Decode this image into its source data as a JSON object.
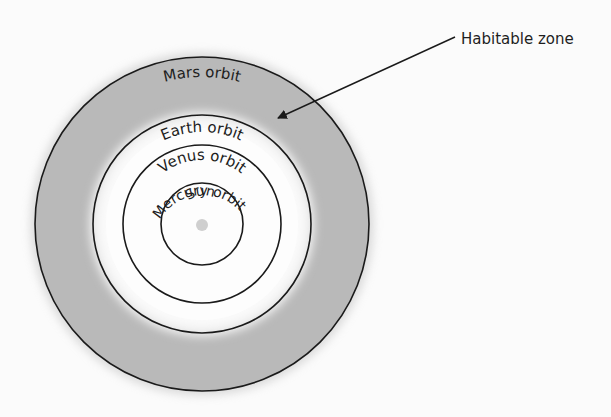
{
  "diagram": {
    "title": "",
    "center": {
      "x": 202,
      "y": 224
    },
    "colors": {
      "background": "#fbfbfb",
      "habitable_zone": "#b8b8b8",
      "orbit_stroke": "#1a1a1a",
      "sun": "#cfcfcf"
    },
    "sun": {
      "label": "Sun",
      "radius": 6
    },
    "orbits": [
      {
        "name": "Mercury",
        "label": "Mercury orbit",
        "radius": 41
      },
      {
        "name": "Venus",
        "label": "Venus orbit",
        "radius": 79
      },
      {
        "name": "Earth",
        "label": "Earth orbit",
        "radius": 109
      },
      {
        "name": "Mars",
        "label": "Mars orbit",
        "radius": 167
      }
    ],
    "habitable_zone": {
      "label": "Habitable zone",
      "inner_orbit": "Earth",
      "outer_orbit": "Mars",
      "arrow": {
        "from": [
          455,
          37
        ],
        "to": [
          277,
          118
        ]
      }
    }
  }
}
